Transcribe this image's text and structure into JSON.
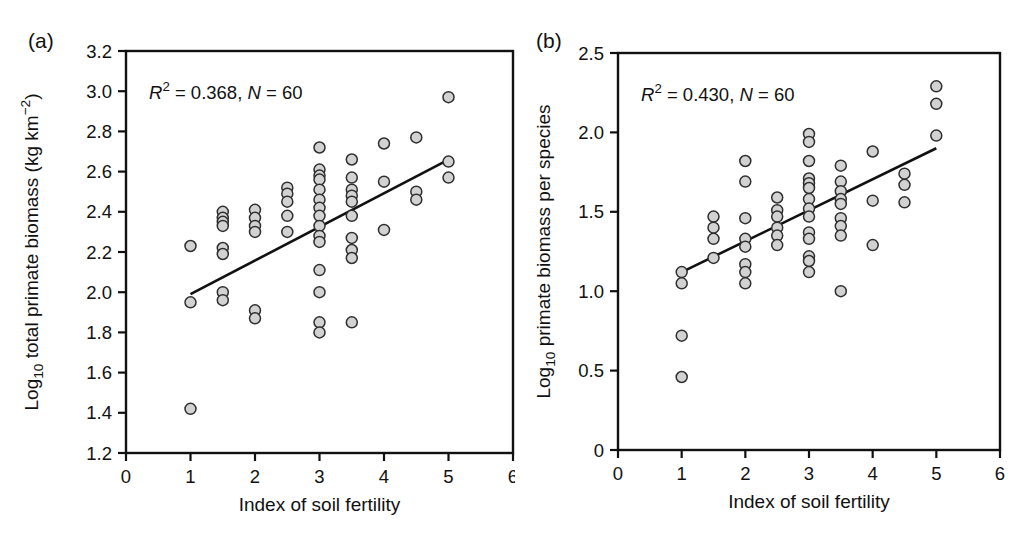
{
  "figure": {
    "background": "#ffffff",
    "text_color": "#111111",
    "frame_color": "#111111"
  },
  "chart_data": [
    {
      "type": "scatter",
      "panel_label": "(a)",
      "r_squared": 0.368,
      "n": 60,
      "annotation_parts": [
        {
          "t": "R",
          "italic": true
        },
        {
          "t": "2",
          "sup": true
        },
        {
          "t": " = 0.368, "
        },
        {
          "t": "N",
          "italic": true
        },
        {
          "t": " = 60"
        }
      ],
      "xlabel": "Index of soil fertility",
      "ylabel_parts": [
        {
          "t": "Log"
        },
        {
          "t": "10",
          "sub": true
        },
        {
          "t": " total primate biomass (kg km"
        },
        {
          "t": "−2",
          "sup": true
        },
        {
          "t": ")"
        }
      ],
      "xlim": [
        0,
        6
      ],
      "ylim": [
        1.2,
        3.2
      ],
      "xticks": {
        "values": [
          0,
          1,
          2,
          3,
          4,
          5,
          6
        ],
        "labels": [
          "0",
          "1",
          "2",
          "3",
          "4",
          "5",
          "6"
        ]
      },
      "yticks": {
        "values": [
          1.2,
          1.4,
          1.6,
          1.8,
          2.0,
          2.2,
          2.4,
          2.6,
          2.8,
          3.0,
          3.2
        ],
        "labels": [
          "1.2",
          "1.4",
          "1.6",
          "1.8",
          "2.0",
          "2.2",
          "2.4",
          "2.6",
          "2.8",
          "3.0",
          "3.2"
        ]
      },
      "grid": false,
      "fit_line": {
        "x1": 1.0,
        "y1": 1.99,
        "x2": 5.0,
        "y2": 2.66
      },
      "line_color": "#111111",
      "marker": {
        "fill": "#d2d2d2",
        "stroke": "#2e2e2e"
      },
      "points": [
        [
          1,
          2.23
        ],
        [
          1,
          1.95
        ],
        [
          1,
          1.42
        ],
        [
          1.5,
          2.4
        ],
        [
          1.5,
          2.37
        ],
        [
          1.5,
          2.35
        ],
        [
          1.5,
          2.33
        ],
        [
          1.5,
          2.22
        ],
        [
          1.5,
          2.19
        ],
        [
          1.5,
          2.0
        ],
        [
          1.5,
          1.96
        ],
        [
          2,
          2.41
        ],
        [
          2,
          2.37
        ],
        [
          2,
          2.33
        ],
        [
          2,
          2.3
        ],
        [
          2,
          1.91
        ],
        [
          2,
          1.87
        ],
        [
          2.5,
          2.52
        ],
        [
          2.5,
          2.49
        ],
        [
          2.5,
          2.45
        ],
        [
          2.5,
          2.38
        ],
        [
          2.5,
          2.3
        ],
        [
          3,
          2.72
        ],
        [
          3,
          2.61
        ],
        [
          3,
          2.58
        ],
        [
          3,
          2.56
        ],
        [
          3,
          2.51
        ],
        [
          3,
          2.46
        ],
        [
          3,
          2.42
        ],
        [
          3,
          2.38
        ],
        [
          3,
          2.33
        ],
        [
          3,
          2.28
        ],
        [
          3,
          2.25
        ],
        [
          3,
          2.11
        ],
        [
          3,
          2.0
        ],
        [
          3,
          1.85
        ],
        [
          3,
          1.8
        ],
        [
          3.5,
          2.66
        ],
        [
          3.5,
          2.57
        ],
        [
          3.5,
          2.51
        ],
        [
          3.5,
          2.48
        ],
        [
          3.5,
          2.45
        ],
        [
          3.5,
          2.38
        ],
        [
          3.5,
          2.27
        ],
        [
          3.5,
          2.21
        ],
        [
          3.5,
          2.17
        ],
        [
          3.5,
          1.85
        ],
        [
          4,
          2.74
        ],
        [
          4,
          2.55
        ],
        [
          4,
          2.31
        ],
        [
          4.5,
          2.77
        ],
        [
          4.5,
          2.5
        ],
        [
          4.5,
          2.46
        ],
        [
          5,
          2.97
        ],
        [
          5,
          2.65
        ],
        [
          5,
          2.57
        ]
      ]
    },
    {
      "type": "scatter",
      "panel_label": "(b)",
      "r_squared": 0.43,
      "n": 60,
      "annotation_parts": [
        {
          "t": "R",
          "italic": true
        },
        {
          "t": "2",
          "sup": true
        },
        {
          "t": " = 0.430, "
        },
        {
          "t": "N",
          "italic": true
        },
        {
          "t": " = 60"
        }
      ],
      "xlabel": "Index of soil fertility",
      "ylabel_parts": [
        {
          "t": "Log"
        },
        {
          "t": "10",
          "sub": true
        },
        {
          "t": " primate biomass per species"
        }
      ],
      "xlim": [
        0,
        6
      ],
      "ylim": [
        0,
        2.5
      ],
      "xticks": {
        "values": [
          0,
          1,
          2,
          3,
          4,
          5,
          6
        ],
        "labels": [
          "0",
          "1",
          "2",
          "3",
          "4",
          "5",
          "6"
        ]
      },
      "yticks": {
        "values": [
          0,
          0.5,
          1.0,
          1.5,
          2.0,
          2.5
        ],
        "labels": [
          "0",
          "0.5",
          "1.0",
          "1.5",
          "2.0",
          "2.5"
        ]
      },
      "grid": false,
      "fit_line": {
        "x1": 1.0,
        "y1": 1.12,
        "x2": 5.0,
        "y2": 1.9
      },
      "line_color": "#111111",
      "marker": {
        "fill": "#d2d2d2",
        "stroke": "#2e2e2e"
      },
      "points": [
        [
          1,
          1.12
        ],
        [
          1,
          1.05
        ],
        [
          1,
          0.72
        ],
        [
          1,
          0.46
        ],
        [
          1.5,
          1.47
        ],
        [
          1.5,
          1.4
        ],
        [
          1.5,
          1.33
        ],
        [
          1.5,
          1.21
        ],
        [
          2,
          1.82
        ],
        [
          2,
          1.69
        ],
        [
          2,
          1.46
        ],
        [
          2,
          1.33
        ],
        [
          2,
          1.28
        ],
        [
          2,
          1.17
        ],
        [
          2,
          1.12
        ],
        [
          2,
          1.05
        ],
        [
          2.5,
          1.59
        ],
        [
          2.5,
          1.51
        ],
        [
          2.5,
          1.47
        ],
        [
          2.5,
          1.4
        ],
        [
          2.5,
          1.35
        ],
        [
          2.5,
          1.29
        ],
        [
          3,
          1.99
        ],
        [
          3,
          1.94
        ],
        [
          3,
          1.82
        ],
        [
          3,
          1.71
        ],
        [
          3,
          1.68
        ],
        [
          3,
          1.65
        ],
        [
          3,
          1.58
        ],
        [
          3,
          1.52
        ],
        [
          3,
          1.47
        ],
        [
          3,
          1.37
        ],
        [
          3,
          1.33
        ],
        [
          3,
          1.22
        ],
        [
          3,
          1.19
        ],
        [
          3,
          1.12
        ],
        [
          3.5,
          1.79
        ],
        [
          3.5,
          1.69
        ],
        [
          3.5,
          1.63
        ],
        [
          3.5,
          1.58
        ],
        [
          3.5,
          1.55
        ],
        [
          3.5,
          1.46
        ],
        [
          3.5,
          1.41
        ],
        [
          3.5,
          1.35
        ],
        [
          3.5,
          1.0
        ],
        [
          4,
          1.88
        ],
        [
          4,
          1.57
        ],
        [
          4,
          1.29
        ],
        [
          4.5,
          1.74
        ],
        [
          4.5,
          1.67
        ],
        [
          4.5,
          1.56
        ],
        [
          5,
          2.29
        ],
        [
          5,
          2.18
        ],
        [
          5,
          1.98
        ]
      ]
    }
  ]
}
